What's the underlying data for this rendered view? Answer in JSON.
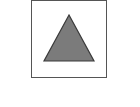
{
  "figure": {
    "frame": {
      "stroke": "#555555",
      "fill": "#ffffff"
    },
    "triangle": {
      "points": "69,15 44,61 94,61",
      "fill": "#7b7b7b",
      "stroke": "#3a3a3a"
    }
  }
}
